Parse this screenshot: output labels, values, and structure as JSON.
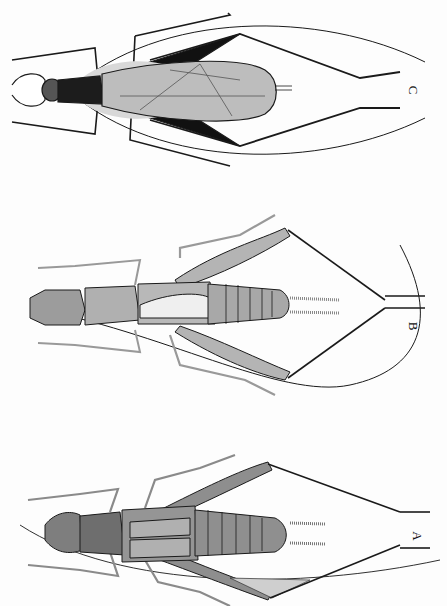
{
  "figure": {
    "specimens": [
      {
        "id": "C",
        "label": "C",
        "description": "Winged insect with dark thorax and veined wings, long hind legs and long antennae curving around body",
        "position": "top"
      },
      {
        "id": "B",
        "label": "B",
        "description": "Cricket with segmented abdomen, hairy cerci, long hind legs and one long curved antenna",
        "position": "middle"
      },
      {
        "id": "A",
        "label": "A",
        "description": "Darker cricket with short wings, segmented abdomen, hairy cerci and long hind legs",
        "position": "bottom"
      }
    ],
    "colors": {
      "background": "#fdfdfd",
      "ink": "#1a1a1a",
      "body_gray": "#a8a8a8",
      "body_dark": "#7a7a7a",
      "wing_light": "#cfcfcf"
    }
  }
}
